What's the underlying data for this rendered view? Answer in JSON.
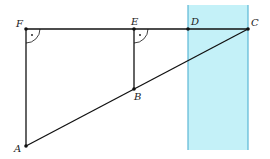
{
  "diagram": {
    "points": {
      "F": {
        "label": "F",
        "x": 26,
        "y": 29
      },
      "E": {
        "label": "E",
        "x": 134,
        "y": 29
      },
      "D": {
        "label": "D",
        "x": 188,
        "y": 29
      },
      "C": {
        "label": "C",
        "x": 248,
        "y": 29
      },
      "B": {
        "label": "B",
        "x": 134,
        "y": 89
      },
      "A": {
        "label": "A",
        "x": 26,
        "y": 146
      }
    },
    "segments": [
      "FC",
      "FA",
      "EB",
      "AC"
    ],
    "right_angles": [
      "F",
      "E"
    ],
    "band": {
      "x1": 188,
      "x2": 248,
      "y1": 5,
      "y2": 150,
      "fill": "#c4f1f8",
      "stroke": "#5bb8d6"
    },
    "colors": {
      "line": "#111111",
      "point": "#111111"
    }
  }
}
